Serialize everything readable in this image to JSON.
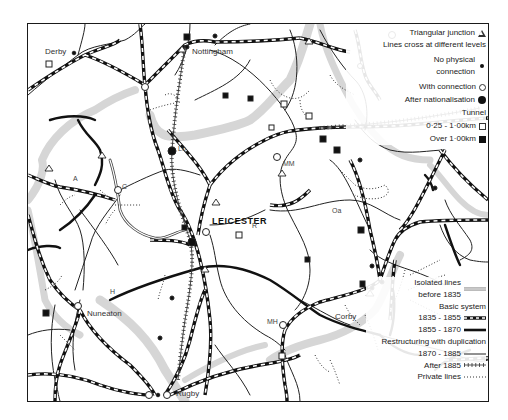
{
  "places": {
    "derby": "Derby",
    "nottingham": "Nottingham",
    "leicester": "LEICESTER",
    "nuneaton": "Nuneaton",
    "rugby": "Rugby",
    "corby": "Corby",
    "lo": "Lo",
    "mm": "MM",
    "oa": "Oa",
    "mh": "MH",
    "a": "A",
    "c": "C",
    "h": "H",
    "r": "R"
  },
  "legend": {
    "triangular_junction": "Triangular junction",
    "lines_cross": "Lines cross at different levels",
    "no_physical_connection": "No physical connection",
    "with_connection": "With connection",
    "after_nationalisation": "After nationalisation",
    "tunnel_heading": "Tunnel",
    "tunnel_short": "0·25 - 1·00km",
    "tunnel_long": "Over 1·00km",
    "isolated_lines": "Isolated lines before 1835",
    "basic_system": "Basic system",
    "basic_1835_1855": "1835 - 1855",
    "basic_1855_1870": "1855 - 1870",
    "restructuring": "Restructuring with duplication",
    "restr_1870_1885": "1870 - 1885",
    "restr_after_1885": "After 1885",
    "private_lines": "Private lines"
  },
  "colors": {
    "ink": "#1a1a1a",
    "relief_shading": "#d4d4d4",
    "background": "#ffffff"
  }
}
